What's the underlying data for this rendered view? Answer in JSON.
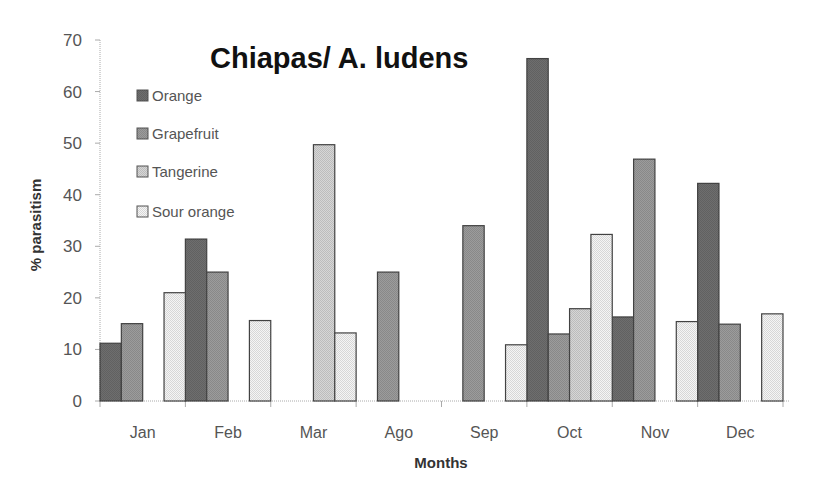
{
  "chart_data": {
    "type": "bar",
    "title": "Chiapas/ A. ludens",
    "xlabel": "Months",
    "ylabel": "% parasitism",
    "ylim": [
      0,
      70
    ],
    "yticks": [
      0,
      10,
      20,
      30,
      40,
      50,
      60,
      70
    ],
    "grid": false,
    "legend_position": "upper-left-inside",
    "categories": [
      "Jan",
      "Feb",
      "Mar",
      "Ago",
      "Sep",
      "Oct",
      "Nov",
      "Dec"
    ],
    "series": [
      {
        "name": "Orange",
        "color": "#6e6e6e",
        "values": [
          11.2,
          31.4,
          0,
          0,
          0,
          66.4,
          16.3,
          42.2
        ]
      },
      {
        "name": "Grapefruit",
        "color": "#9c9c9c",
        "values": [
          15.0,
          25.0,
          0,
          25.0,
          34.0,
          13.0,
          46.9,
          14.9
        ]
      },
      {
        "name": "Tangerine",
        "color": "#d6d6d6",
        "values": [
          0,
          0,
          49.7,
          0,
          0,
          17.9,
          0,
          0
        ]
      },
      {
        "name": "Sour orange",
        "color": "#f5f5f5",
        "values": [
          21.0,
          15.6,
          13.2,
          0,
          10.9,
          32.3,
          15.4,
          16.9
        ]
      }
    ]
  },
  "layout": {
    "plot_left": 100,
    "plot_right": 783,
    "plot_top": 40,
    "plot_bottom": 401,
    "border_color": "#444444",
    "axis_color": "#aaaaaa"
  }
}
